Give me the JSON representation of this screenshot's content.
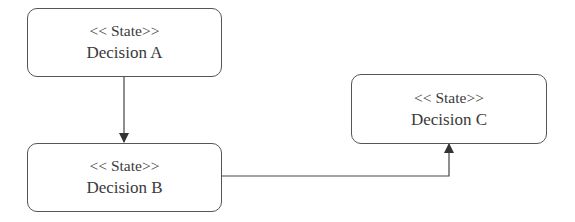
{
  "diagram": {
    "type": "UML state diagram",
    "states": [
      {
        "id": "A",
        "stereotype": "<< State>>",
        "name": "Decision A"
      },
      {
        "id": "B",
        "stereotype": "<< State>>",
        "name": "Decision B"
      },
      {
        "id": "C",
        "stereotype": "<< State>>",
        "name": "Decision C"
      }
    ],
    "transitions": [
      {
        "from": "A",
        "to": "B"
      },
      {
        "from": "B",
        "to": "C"
      }
    ]
  }
}
